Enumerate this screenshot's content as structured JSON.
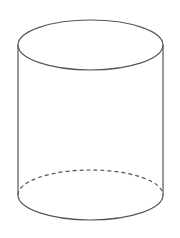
{
  "diagram": {
    "type": "cylinder",
    "projection": "oblique",
    "stroke_color": "#555555",
    "background": "#ffffff",
    "geometry": {
      "cx": 90.5,
      "rx": 72.5,
      "ry": 25,
      "top_cy": 45,
      "bottom_cy": 195,
      "left_x": 18,
      "right_x": 163
    },
    "elements": [
      {
        "name": "top-face",
        "style": "solid"
      },
      {
        "name": "left-side",
        "style": "solid"
      },
      {
        "name": "right-side",
        "style": "solid"
      },
      {
        "name": "bottom-front-arc",
        "style": "solid"
      },
      {
        "name": "bottom-back-arc",
        "style": "dashed",
        "note": "hidden edge"
      }
    ]
  }
}
